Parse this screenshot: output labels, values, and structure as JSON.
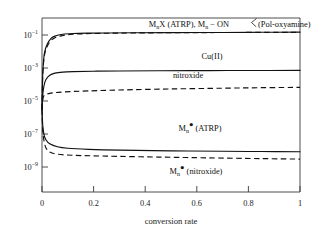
{
  "chart_data": {
    "type": "line",
    "title": "",
    "xlabel": "conversion rate",
    "ylabel": "",
    "xlim": [
      0,
      1
    ],
    "ylim": [
      1e-10,
      0.3
    ],
    "yscale": "log",
    "grid": false,
    "legend_position": "inline-annotations",
    "xticks": [
      "0",
      "0.2",
      "0.4",
      "0.6",
      "0.8",
      "1"
    ],
    "xtick_values": [
      0,
      0.2,
      0.4,
      0.6,
      0.8,
      1
    ],
    "yticks": [
      "10-1",
      "10-3",
      "10-5",
      "10-7",
      "10-9"
    ],
    "ytick_values": [
      0.1,
      0.001,
      1e-05,
      1e-07,
      1e-09
    ],
    "ytick_mantissa": "10",
    "ytick_exponents": [
      "-1",
      "-3",
      "-5",
      "-7",
      "-9"
    ],
    "series": [
      {
        "name": "MnX (ATRP)",
        "style": "solid",
        "label_text_parts": {
          "m": "M",
          "n": "n",
          "rest": "X (ATRP),"
        },
        "x": [
          0,
          0.002,
          0.005,
          0.01,
          0.02,
          0.035,
          0.05,
          0.08,
          0.12,
          0.18,
          0.25,
          0.35,
          0.5,
          0.7,
          0.85,
          1
        ],
        "y": [
          3.2e-06,
          0.00012,
          0.0009,
          0.004,
          0.011,
          0.023,
          0.031,
          0.039,
          0.043,
          0.045,
          0.046,
          0.047,
          0.048,
          0.049,
          0.05,
          0.051
        ]
      },
      {
        "name": "Mn-ON (Pol-oxyamine)",
        "style": "dashed",
        "x": [
          0,
          0.002,
          0.005,
          0.01,
          0.02,
          0.035,
          0.05,
          0.07,
          0.09,
          0.12,
          0.2,
          0.35,
          0.6,
          1
        ],
        "y": [
          3.2e-06,
          0.0001,
          0.0007,
          0.003,
          0.0085,
          0.018,
          0.025,
          0.031,
          0.035,
          0.039,
          0.043,
          0.046,
          0.048,
          0.05
        ]
      },
      {
        "name": "Cu(II)",
        "style": "solid",
        "x": [
          0,
          0.003,
          0.008,
          0.015,
          0.03,
          0.05,
          0.08,
          0.12,
          0.2,
          0.3,
          0.45,
          0.65,
          0.85,
          1
        ],
        "y": [
          3.2e-06,
          2e-05,
          6.5e-05,
          0.00013,
          0.00023,
          0.0003,
          0.00034,
          0.00036,
          0.00038,
          0.00039,
          0.0004,
          0.00041,
          0.000415,
          0.00042
        ]
      },
      {
        "name": "nitroxide",
        "style": "dashed",
        "x": [
          0,
          0.004,
          0.01,
          0.02,
          0.04,
          0.08,
          0.15,
          0.3,
          0.5,
          0.7,
          0.85,
          1
        ],
        "y": [
          3.2e-06,
          1.3e-05,
          1.9e-05,
          2.2e-05,
          2.5e-05,
          2.8e-05,
          3.1e-05,
          3.6e-05,
          4.1e-05,
          4.5e-05,
          4.8e-05,
          5e-05
        ]
      },
      {
        "name": "Mn radical (ATRP)",
        "style": "solid",
        "x": [
          0,
          0.003,
          0.008,
          0.015,
          0.03,
          0.06,
          0.1,
          0.18,
          0.3,
          0.5,
          0.7,
          0.85,
          1
        ],
        "y": [
          3.2e-06,
          4e-07,
          1.3e-07,
          7e-08,
          4.2e-08,
          2.9e-08,
          2.4e-08,
          2.1e-08,
          1.9e-08,
          1.75e-08,
          1.65e-08,
          1.6e-08,
          1.55e-08
        ]
      },
      {
        "name": "Mn radical (nitroxide)",
        "style": "dashed",
        "x": [
          0,
          0.003,
          0.008,
          0.015,
          0.03,
          0.06,
          0.12,
          0.25,
          0.45,
          0.65,
          0.85,
          1
        ],
        "y": [
          3.2e-06,
          2e-07,
          6e-08,
          2.6e-08,
          1.5e-08,
          1.15e-08,
          1e-08,
          9e-09,
          8e-09,
          7.2e-09,
          6.6e-09,
          6.2e-09
        ]
      }
    ],
    "annotations": [
      {
        "id": "label-mnx-oxyamine",
        "text": "MnX (ATRP), Mn-ON( (Pol-oxyamine)",
        "x": 0.45,
        "y": 0.13
      },
      {
        "id": "label-cu2",
        "text": "Cu(II)",
        "x": 0.62,
        "y": 0.0025
      },
      {
        "id": "label-nitroxide",
        "text": "nitroxide",
        "x": 0.54,
        "y": 0.00015
      },
      {
        "id": "label-mn-atrp",
        "text": "Mn (ATRP)",
        "x": 0.58,
        "y": 2.2e-07
      },
      {
        "id": "label-mn-nitroxide",
        "text": "Mn (nitroxide)",
        "x": 0.55,
        "y": 1.1e-09
      }
    ]
  },
  "labels": {
    "top_part1_m": "M",
    "top_part1_sub": "n",
    "top_part1_tail": "X (ATRP), ",
    "top_part2_m": "M",
    "top_part2_sub": "n",
    "top_part2_bond": " − ON",
    "top_part3": " (Pol-oxyamine)",
    "cu2": "Cu(II)",
    "nitroxide": "nitroxide",
    "mn_radical_m": "M",
    "mn_radical_sub": "n",
    "mn_radical_dot": "●",
    "mn_radical_atrp_tail": " (ATRP)",
    "mn_radical_nitroxide_tail": " (nitroxide)",
    "xaxis_title": "conversion rate",
    "ytick_base": "10",
    "ytick_e1": "−1",
    "ytick_e3": "−3",
    "ytick_e5": "−5",
    "ytick_e7": "−7",
    "ytick_e9": "−9",
    "xtick_0": "0",
    "xtick_02": "0.2",
    "xtick_04": "0.4",
    "xtick_06": "0.6",
    "xtick_08": "0.8",
    "xtick_1": "1"
  },
  "colors": {
    "curve": "#111111",
    "axis": "#3a3a3a",
    "text": "#1a1a1a",
    "background": "#ffffff"
  }
}
